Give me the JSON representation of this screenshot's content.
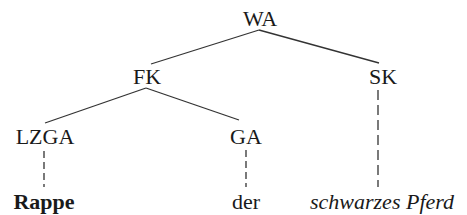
{
  "tree": {
    "root": {
      "label": "WA",
      "x": 260,
      "y": 8
    },
    "nodes": [
      {
        "id": "FK",
        "label": "FK",
        "x": 147,
        "y": 66
      },
      {
        "id": "SK",
        "label": "SK",
        "x": 383,
        "y": 66
      },
      {
        "id": "LZGA",
        "label": "LZGA",
        "x": 45,
        "y": 126
      },
      {
        "id": "GA",
        "label": "GA",
        "x": 246,
        "y": 126
      }
    ],
    "leaves": [
      {
        "id": "rappe",
        "label": "Rappe",
        "style": "bold",
        "x": 44,
        "y": 191
      },
      {
        "id": "der",
        "label": "der",
        "style": "normal",
        "x": 246,
        "y": 191
      },
      {
        "id": "schwarzes-pferd",
        "label": "schwarzes Pferd",
        "style": "italic",
        "x": 380,
        "y": 191
      }
    ],
    "edges": [
      {
        "from": "WA",
        "to": "FK",
        "type": "solid"
      },
      {
        "from": "WA",
        "to": "SK",
        "type": "solid"
      },
      {
        "from": "FK",
        "to": "LZGA",
        "type": "solid"
      },
      {
        "from": "FK",
        "to": "GA",
        "type": "solid"
      },
      {
        "from": "LZGA",
        "to": "Rappe",
        "type": "dashed"
      },
      {
        "from": "GA",
        "to": "der",
        "type": "dashed"
      },
      {
        "from": "SK",
        "to": "schwarzes Pferd",
        "type": "dashed"
      }
    ]
  }
}
